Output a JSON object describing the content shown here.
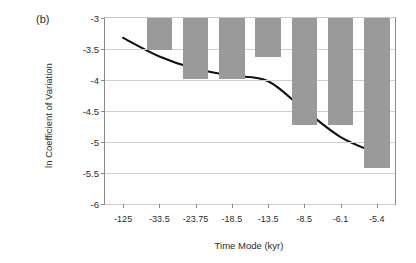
{
  "figure": {
    "panel_label": "(b)",
    "bar_color": "#9a9a9a",
    "curve_color": "#111111",
    "grid_color": "#d0d0d0",
    "axis_color": "#8a8a8a"
  },
  "chart_data": {
    "type": "bar",
    "title": "",
    "xlabel": "Time Mode (kyr)",
    "ylabel": "ln Coefficient of Variation",
    "categories": [
      "-125",
      "-33.5",
      "-23.75",
      "-18.5",
      "-13.5",
      "-8.5",
      "-6.1",
      "-5.4"
    ],
    "ylim": [
      -6,
      -3
    ],
    "yticks": [
      "-3",
      "-3.5",
      "-4",
      "-4.5",
      "-5",
      "-5.5",
      "-6"
    ],
    "ytick_values": [
      -3,
      -3.5,
      -4,
      -4.5,
      -5,
      -5.5,
      -6
    ],
    "grid": true,
    "legend": "none",
    "bars_hang_from_top": true,
    "series": [
      {
        "name": "ln Coefficient of Variation (bars)",
        "values": [
          -3.0,
          -3.52,
          -3.99,
          -3.99,
          -3.63,
          -4.73,
          -4.73,
          -5.42
        ]
      },
      {
        "name": "trend (smoothed curve)",
        "type": "line",
        "x": [
          "-125",
          "-33.5",
          "-23.75",
          "-18.5",
          "-13.5",
          "-8.5",
          "-6.1",
          "-5.4"
        ],
        "values": [
          -3.32,
          -3.62,
          -3.82,
          -3.93,
          -4.02,
          -4.48,
          -4.92,
          -5.18
        ]
      }
    ]
  }
}
